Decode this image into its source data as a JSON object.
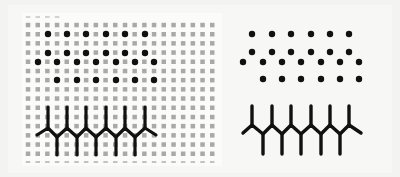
{
  "figure": {
    "left_panel": {
      "description": "Dot and fence patterns overlaid on a gray square grid",
      "grid": {
        "columns": 20,
        "rows": 15,
        "x0": 28,
        "y0": 25,
        "pitch_x": 9.7,
        "pitch_y": 9.2,
        "square_size": 4.5,
        "color": "#a9a9a9",
        "dashed_rows_y": [
          17,
          162
        ]
      },
      "dots": {
        "color": "#111111",
        "radius": 3.2,
        "rows": [
          {
            "y": 34,
            "x": [
              48,
              67,
              86,
              106,
              125,
              145
            ]
          },
          {
            "y": 53,
            "x": [
              48,
              67,
              86,
              106,
              125,
              145
            ]
          },
          {
            "y": 62,
            "x": [
              38,
              57,
              77,
              96,
              116,
              135,
              154
            ]
          },
          {
            "y": 80,
            "x": [
              57,
              77,
              96,
              116,
              135,
              154
            ]
          }
        ]
      },
      "fence": {
        "color": "#111111",
        "stroke_width": 3.2,
        "up_stems_x": [
          48,
          67,
          86,
          106,
          125,
          145
        ],
        "up_top_y": 107,
        "peak_y": 128,
        "down_stems_x": [
          57,
          77,
          96,
          116,
          135
        ],
        "valley_y": 137,
        "down_bottom_y": 155,
        "start": [
          37,
          135
        ],
        "end": [
          156,
          135
        ]
      }
    },
    "right_panel": {
      "description": "Same dot and fence patterns without the grid",
      "dots": {
        "color": "#111111",
        "radius": 3.2,
        "rows": [
          {
            "y": 34,
            "x": [
              252,
              272,
              291,
              311,
              330,
              349
            ]
          },
          {
            "y": 52,
            "x": [
              252,
              272,
              291,
              311,
              330,
              349
            ]
          },
          {
            "y": 62,
            "x": [
              243,
              263,
              282,
              301,
              321,
              340,
              359
            ]
          },
          {
            "y": 79,
            "x": [
              263,
              282,
              301,
              321,
              340,
              359
            ]
          }
        ]
      },
      "fence": {
        "color": "#111111",
        "stroke_width": 3.4,
        "up_stems_x": [
          252,
          272,
          291,
          311,
          330,
          349
        ],
        "up_top_y": 106,
        "peak_y": 125,
        "down_stems_x": [
          263,
          282,
          301,
          321,
          340
        ],
        "valley_y": 134,
        "down_bottom_y": 154,
        "start": [
          243,
          133
        ],
        "end": [
          361,
          133
        ]
      }
    }
  }
}
